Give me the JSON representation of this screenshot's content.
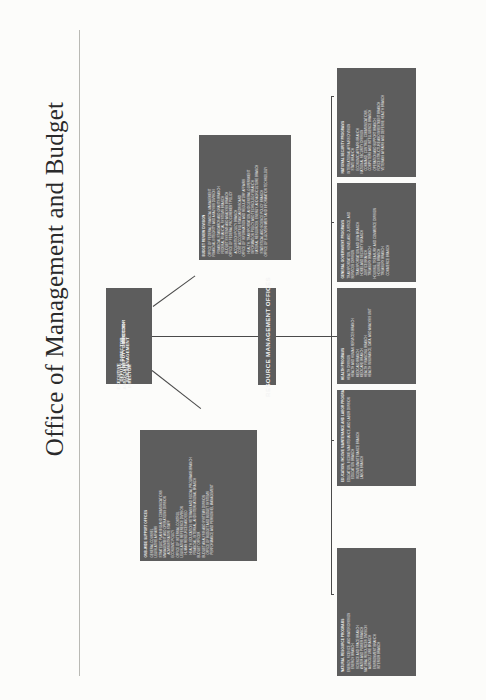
{
  "page": {
    "title": "Office of Management and Budget"
  },
  "leadership": {
    "items": [
      {
        "label": "DIRECTOR"
      },
      {
        "label": "DEPUTY DIRECTOR"
      },
      {
        "label": "DEPUTY DIRECTOR\nFOR MANAGEMENT"
      },
      {
        "label": "EXECUTIVE\nASSOCIATE\nDIRECTOR"
      }
    ]
  },
  "rmo": {
    "label": "RESOURCE MANAGEMENT OFFICES"
  },
  "budget_review": {
    "header": "BUDGET REVIEW DIVISION",
    "items": [
      "OFFICE OF FEDERAL FINANCIAL MANAGEMENT",
      "FINANCIAL INTEGRITY AND ANALYSIS DIVISION",
      "FINANCIAL STANDARDS AND GRANTS BRANCH",
      "FEDERAL FINANCIAL SYSTEMS BRANCH",
      "BUDGET SYSTEMS AND ANALYSIS BRANCH",
      "OFFICE OF FEDERAL PROCUREMENT POLICY",
      "ACQUISITION POLICY BRANCH",
      "COST ACCOUNTING STANDARDS BOARD",
      "OFFICE OF INFORMATION AND REGULATORY AFFAIRS",
      "HEALTH, TRANSPORTATION, AND GENERAL GOVERNMENT",
      "INFORMATION POLICY AND TECHNOLOGY BRANCH",
      "NATURAL RESOURCES, ENERGY, AND AGRICULTURE BRANCH",
      "STATISTICAL AND SCIENCE POLICY BRANCH",
      "OFFICE OF E-GOVERNMENT AND INFORMATION TECHNOLOGY"
    ]
  },
  "omb_wide": {
    "header": "OMB-WIDE SUPPORT OFFICES",
    "items": [
      "GENERAL COUNSEL",
      "LEGISLATIVE AFFAIRS",
      "STRATEGIC PLANNING AND COMMUNICATIONS",
      "MANAGEMENT AND OPERATIONS DIVISION",
      "ADMINISTRATIVE STAFF",
      "ECONOMIC POLICY",
      "OFFICE OF INTERNAL CONTROL",
      "LEGISLATIVE REFERENCE DIVISION",
      "HUMAN RESOURCES AND EEO",
      "HEALTH, EDUCATION, VETERANS AND SOCIAL PROGRAMS BRANCH",
      "FINANCIAL, INTERNAL, AND INTERNATIONAL BRANCH",
      "BUDGET OFFICER",
      "BUDGET ANALYSIS AND SYSTEMS DIVISION",
      "OFFICE OF BUDGET AND BUDGET SYSTEMS",
      "PERFORMANCE AND PERSONNEL MANAGEMENT"
    ]
  },
  "rmo_divisions": [
    {
      "header": "NATIONAL SECURITY PROGRAMS",
      "items": [
        "INTERNATIONAL AFFAIRS DIVISION",
        "STATE BRANCH",
        "ECONOMIC AFFAIRS BRANCH",
        "NATIONAL SECURITY DIVISION",
        "COMMAND, CONTROL, COMMUNICATIONS,",
        "COMPUTERS AND INTELLIGENCE BRANCH",
        "OPERATION AND SUPPORT BRANCH",
        "FORCE STRUCTURE AND INVESTMENT BRANCH",
        "VETERANS AFFAIRS AND DEFENSE HEALTH BRANCH"
      ]
    },
    {
      "header": "GENERAL GOVERNMENT PROGRAMS",
      "items": [
        "TRANSPORTATION, HOMELAND, JUSTICE, AND",
        "SERVICES DIVISION",
        "TRANSPORTATION AND GSA BRANCH",
        "HOMELAND SECURITY BRANCH",
        "JUSTICE BRANCH",
        "TREASURY BRANCH",
        "HOUSING, TREASURY, AND COMMERCE DIVISION",
        "HOUSING BRANCH",
        "TREASURY BRANCH",
        "COMMERCE BRANCH"
      ]
    },
    {
      "header": "HEALTH PROGRAMS",
      "items": [
        "HEALTH DIVISION",
        "HEALTH AND HUMAN SERVICES BRANCH",
        "MEDICAID BRANCH",
        "MEDICARE BRANCH",
        "HEALTH FINANCING BRANCH",
        "HEALTH INSURANCE, DATA, AND ANALYSIS UNIT"
      ]
    },
    {
      "header": "EDUCATION, INCOME MAINTENANCE AND LABOR PROGRAMS",
      "items": [
        "EDUCATION, INCOME MAINTENANCE, AND LABOR DIVISION",
        "EDUCATION BRANCH",
        "INCOME MAINTENANCE BRANCH",
        "LABOR BRANCH"
      ]
    },
    {
      "header": "NATURAL RESOURCE PROGRAMS",
      "items": [
        "ENERGY, SCIENCE, AND WATER DIVISION",
        "ENERGY BRANCH",
        "SCIENCE AND SPACE BRANCH",
        "WATER AND POWER BRANCH",
        "NATURAL RESOURCES DIVISION",
        "AGRICULTURE BRANCH",
        "ENVIRONMENT BRANCH",
        "INTERIOR BRANCH"
      ]
    }
  ]
}
